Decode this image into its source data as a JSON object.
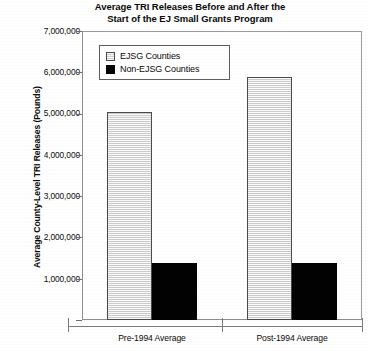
{
  "chart_data": {
    "type": "bar",
    "title": "Average TRI Releases Before and After the Start of the EJ Small Grants Program",
    "title_lines": [
      "Average TRI Releases Before and After the",
      "Start of the EJ Small Grants Program"
    ],
    "xlabel": "",
    "ylabel": "Average County-Level TRI Releases (Pounds)",
    "categories": [
      "Pre-1994 Average",
      "Post-1994 Average"
    ],
    "series": [
      {
        "name": "EJSG Counties",
        "color": "#dcdcdc",
        "values": [
          5040000,
          5880000
        ]
      },
      {
        "name": "Non-EJSG Counties",
        "color": "#020202",
        "values": [
          1380000,
          1380000
        ]
      }
    ],
    "ylim": [
      0,
      7000000
    ],
    "ytick_values": [
      0,
      1000000,
      2000000,
      3000000,
      4000000,
      5000000,
      6000000,
      7000000
    ],
    "ytick_labels": [
      "-",
      "1,000,000",
      "2,000,000",
      "3,000,000",
      "4,000,000",
      "5,000,000",
      "6,000,000",
      "7,000,000"
    ],
    "grid": false,
    "legend_position": "upper-left-inside"
  },
  "legend": {
    "entries": [
      {
        "label": "EJSG Counties",
        "swatch": "light-gray-square"
      },
      {
        "label": "Non-EJSG Counties",
        "swatch": "black-square"
      }
    ]
  }
}
